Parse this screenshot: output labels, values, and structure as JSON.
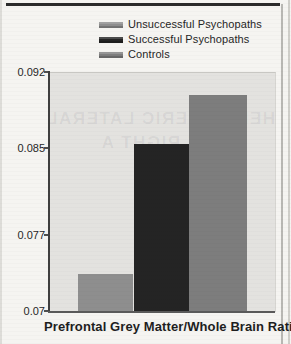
{
  "colors": {
    "page_bg": "#f5f4f1",
    "top_rule": "#2b2b2b",
    "text": "#222222",
    "plot_bg": "#e3e2df",
    "axis": "#4f4f4f"
  },
  "legend": {
    "items": [
      {
        "label": "Unsuccessful Psychopaths",
        "color": "#8e8e8e"
      },
      {
        "label": "Successful Psychopaths",
        "color": "#242424"
      },
      {
        "label": "Controls",
        "color": "#7d7d7d"
      }
    ]
  },
  "chart_data": {
    "type": "bar",
    "title": "",
    "xlabel": "Prefrontal Grey Matter/Whole Brain Ratio",
    "ylabel": "",
    "categories": [
      "Unsuccessful Psychopaths",
      "Successful Psychopaths",
      "Controls"
    ],
    "values": [
      0.0735,
      0.0855,
      0.09
    ],
    "series_colors": [
      "#8e8e8e",
      "#242424",
      "#7d7d7d"
    ],
    "ylim": [
      0.07,
      0.092
    ],
    "ytick_labels": [
      "0.092",
      "0.085",
      "0.077",
      "0.07"
    ],
    "ytick_values": [
      0.092,
      0.085,
      0.077,
      0.07
    ],
    "grid": false,
    "legend_position": "top",
    "plot_bg": "#e3e2df"
  },
  "artifacts": {
    "bleed_through_lines": [
      "HEMISPHERIC LATERALI",
      "THE RIGHT A"
    ]
  }
}
